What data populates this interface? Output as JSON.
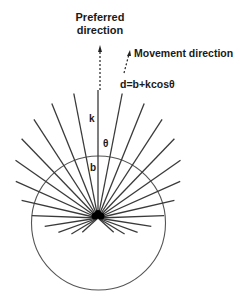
{
  "labels": {
    "preferred_line1": "Preferred",
    "preferred_line2": "direction",
    "movement": "Movement direction",
    "formula": "d=b+kcosθ",
    "k": "k",
    "theta": "θ",
    "b": "b"
  },
  "geometry": {
    "origin": [
      98,
      218
    ],
    "circle_center": [
      98.5,
      223
    ],
    "circle_radius": 67,
    "b": 64,
    "k": 64,
    "ray_spacing_deg": 11,
    "ray_max_deg": 132
  },
  "colors": {
    "ray": "#3a3a3a",
    "text": "#1a1a1a",
    "circle": "#555555"
  }
}
